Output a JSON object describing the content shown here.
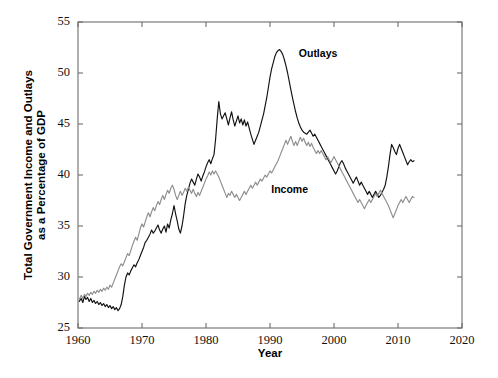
{
  "chart_data": {
    "type": "line",
    "title": "",
    "xlabel": "Year",
    "ylabel": "Total Government Income and Outlays as a Percentage of GDP",
    "ylabel_line1": "Total Government Income and Outlays",
    "ylabel_line2": "as a Percentage of GDP",
    "xlim": [
      1960,
      2020
    ],
    "ylim": [
      25,
      55
    ],
    "xticks": [
      1960,
      1970,
      1980,
      1990,
      2000,
      2010,
      2020
    ],
    "yticks": [
      25,
      30,
      35,
      40,
      45,
      50,
      55
    ],
    "xtick_labels": [
      "1960",
      "1970",
      "1980",
      "1990",
      "2000",
      "2010",
      "2020"
    ],
    "ytick_labels": [
      "25",
      "30",
      "35",
      "40",
      "45",
      "50",
      "55"
    ],
    "grid": false,
    "legend_position": "inline-annotation",
    "colors": {
      "outlays": "#111111",
      "income": "#8e8e8e",
      "axis": "#6d6d6d"
    },
    "annotations": [
      {
        "text": "Outlays",
        "x": 1994.5,
        "y": 51.6
      },
      {
        "text": "Income",
        "x": 1990.2,
        "y": 38.2
      }
    ],
    "series": [
      {
        "name": "Outlays",
        "color": "#111111",
        "x": [
          1960.2,
          1960.5,
          1960.75,
          1961,
          1961.25,
          1961.5,
          1961.75,
          1962,
          1962.25,
          1962.5,
          1962.75,
          1963,
          1963.25,
          1963.5,
          1963.75,
          1964,
          1964.25,
          1964.5,
          1964.75,
          1965,
          1965.25,
          1965.5,
          1965.75,
          1966,
          1966.25,
          1966.5,
          1966.75,
          1967,
          1967.25,
          1967.5,
          1967.75,
          1968,
          1968.25,
          1968.5,
          1968.75,
          1969,
          1969.25,
          1969.5,
          1969.75,
          1970,
          1970.25,
          1970.5,
          1970.75,
          1971,
          1971.25,
          1971.5,
          1971.75,
          1972,
          1972.25,
          1972.5,
          1972.75,
          1973,
          1973.25,
          1973.5,
          1973.75,
          1974,
          1974.25,
          1974.5,
          1974.75,
          1975,
          1975.25,
          1975.5,
          1975.75,
          1976,
          1976.25,
          1976.5,
          1976.75,
          1977,
          1977.25,
          1977.5,
          1977.75,
          1978,
          1978.25,
          1978.5,
          1978.75,
          1979,
          1979.25,
          1979.5,
          1979.75,
          1980,
          1980.25,
          1980.5,
          1980.75,
          1981,
          1981.25,
          1981.5,
          1981.75,
          1982,
          1982.25,
          1982.5,
          1982.75,
          1983,
          1983.25,
          1983.5,
          1983.75,
          1984,
          1984.25,
          1984.5,
          1984.75,
          1985,
          1985.25,
          1985.5,
          1985.75,
          1986,
          1986.25,
          1986.5,
          1986.75,
          1987,
          1987.25,
          1987.5,
          1987.75,
          1988,
          1988.25,
          1988.5,
          1988.75,
          1989,
          1989.25,
          1989.5,
          1989.75,
          1990,
          1990.25,
          1990.5,
          1990.75,
          1991,
          1991.25,
          1991.5,
          1991.75,
          1992,
          1992.25,
          1992.5,
          1992.75,
          1993,
          1993.25,
          1993.5,
          1993.75,
          1994,
          1994.25,
          1994.5,
          1994.75,
          1995,
          1995.25,
          1995.5,
          1995.75,
          1996,
          1996.25,
          1996.5,
          1996.75,
          1997,
          1997.25,
          1997.5,
          1997.75,
          1998,
          1998.25,
          1998.5,
          1998.75,
          1999,
          1999.25,
          1999.5,
          1999.75,
          2000,
          2000.25,
          2000.5,
          2000.75,
          2001,
          2001.25,
          2001.5,
          2001.75,
          2002,
          2002.25,
          2002.5,
          2002.75,
          2003,
          2003.25,
          2003.5,
          2003.75,
          2004,
          2004.25,
          2004.5,
          2004.75,
          2005,
          2005.25,
          2005.5,
          2005.75,
          2006,
          2006.25,
          2006.5,
          2006.75,
          2007,
          2007.25,
          2007.5,
          2007.75,
          2008,
          2008.25,
          2008.5,
          2008.75,
          2009,
          2009.25,
          2009.5,
          2009.75,
          2010,
          2010.25,
          2010.5,
          2010.75,
          2011,
          2011.25,
          2011.5,
          2011.75,
          2012,
          2012.25,
          2012.5
        ],
        "y": [
          27.6,
          27.9,
          27.5,
          28.1,
          27.8,
          28.0,
          27.6,
          27.9,
          27.5,
          27.7,
          27.4,
          27.6,
          27.3,
          27.5,
          27.2,
          27.4,
          27.1,
          27.3,
          27.0,
          27.2,
          26.9,
          27.1,
          26.8,
          27.0,
          26.7,
          26.9,
          27.3,
          28.1,
          29.2,
          30.0,
          30.4,
          30.2,
          30.6,
          30.9,
          31.2,
          31.0,
          31.4,
          31.7,
          32.1,
          32.5,
          32.9,
          33.4,
          33.6,
          33.9,
          34.2,
          34.6,
          34.3,
          34.5,
          34.8,
          35.1,
          34.6,
          34.3,
          34.7,
          35.0,
          34.4,
          35.2,
          34.8,
          35.6,
          36.2,
          37.0,
          36.2,
          35.5,
          34.7,
          34.3,
          35.0,
          36.0,
          37.2,
          38.0,
          38.6,
          39.2,
          39.6,
          39.3,
          39.0,
          39.6,
          40.1,
          39.8,
          39.4,
          39.9,
          40.3,
          40.8,
          41.2,
          41.5,
          41.1,
          41.6,
          42.0,
          43.5,
          45.5,
          47.2,
          46.0,
          45.5,
          45.8,
          46.1,
          45.5,
          44.9,
          45.6,
          46.2,
          45.4,
          44.8,
          45.3,
          45.8,
          45.1,
          45.5,
          44.9,
          45.4,
          44.8,
          45.2,
          44.6,
          44.0,
          43.5,
          43.0,
          43.4,
          43.8,
          44.2,
          44.8,
          45.4,
          46.0,
          46.8,
          47.6,
          48.6,
          49.6,
          50.4,
          51.0,
          51.6,
          52.0,
          52.2,
          52.3,
          52.1,
          51.8,
          51.3,
          50.7,
          50.0,
          49.2,
          48.4,
          47.6,
          46.9,
          46.2,
          45.6,
          45.1,
          44.7,
          44.4,
          44.2,
          44.1,
          44.0,
          44.2,
          44.4,
          44.1,
          43.8,
          44.0,
          43.7,
          43.4,
          43.1,
          42.8,
          42.5,
          42.2,
          41.9,
          41.6,
          41.3,
          41.0,
          40.7,
          40.4,
          40.1,
          40.4,
          40.8,
          41.2,
          41.4,
          41.1,
          40.7,
          40.4,
          40.1,
          39.8,
          39.5,
          39.2,
          39.5,
          39.8,
          39.4,
          39.0,
          39.3,
          39.0,
          38.7,
          38.4,
          38.1,
          38.4,
          38.1,
          37.8,
          38.1,
          38.4,
          38.1,
          37.8,
          38.0,
          38.3,
          38.6,
          39.0,
          39.8,
          40.8,
          42.0,
          43.0,
          42.7,
          42.3,
          42.0,
          42.6,
          43.0,
          42.6,
          42.2,
          41.8,
          41.4,
          41.0,
          41.3,
          41.5,
          41.3,
          41.4
        ]
      },
      {
        "name": "Income",
        "color": "#8e8e8e",
        "x": [
          1960.2,
          1960.5,
          1960.75,
          1961,
          1961.25,
          1961.5,
          1961.75,
          1962,
          1962.25,
          1962.5,
          1962.75,
          1963,
          1963.25,
          1963.5,
          1963.75,
          1964,
          1964.25,
          1964.5,
          1964.75,
          1965,
          1965.25,
          1965.5,
          1965.75,
          1966,
          1966.25,
          1966.5,
          1966.75,
          1967,
          1967.25,
          1967.5,
          1967.75,
          1968,
          1968.25,
          1968.5,
          1968.75,
          1969,
          1969.25,
          1969.5,
          1969.75,
          1970,
          1970.25,
          1970.5,
          1970.75,
          1971,
          1971.25,
          1971.5,
          1971.75,
          1972,
          1972.25,
          1972.5,
          1972.75,
          1973,
          1973.25,
          1973.5,
          1973.75,
          1974,
          1974.25,
          1974.5,
          1974.75,
          1975,
          1975.25,
          1975.5,
          1975.75,
          1976,
          1976.25,
          1976.5,
          1976.75,
          1977,
          1977.25,
          1977.5,
          1977.75,
          1978,
          1978.25,
          1978.5,
          1978.75,
          1979,
          1979.25,
          1979.5,
          1979.75,
          1980,
          1980.25,
          1980.5,
          1980.75,
          1981,
          1981.25,
          1981.5,
          1981.75,
          1982,
          1982.25,
          1982.5,
          1982.75,
          1983,
          1983.25,
          1983.5,
          1983.75,
          1984,
          1984.25,
          1984.5,
          1984.75,
          1985,
          1985.25,
          1985.5,
          1985.75,
          1986,
          1986.25,
          1986.5,
          1986.75,
          1987,
          1987.25,
          1987.5,
          1987.75,
          1988,
          1988.25,
          1988.5,
          1988.75,
          1989,
          1989.25,
          1989.5,
          1989.75,
          1990,
          1990.25,
          1990.5,
          1990.75,
          1991,
          1991.25,
          1991.5,
          1991.75,
          1992,
          1992.25,
          1992.5,
          1992.75,
          1993,
          1993.25,
          1993.5,
          1993.75,
          1994,
          1994.25,
          1994.5,
          1994.75,
          1995,
          1995.25,
          1995.5,
          1995.75,
          1996,
          1996.25,
          1996.5,
          1996.75,
          1997,
          1997.25,
          1997.5,
          1997.75,
          1998,
          1998.25,
          1998.5,
          1998.75,
          1999,
          1999.25,
          1999.5,
          1999.75,
          2000,
          2000.25,
          2000.5,
          2000.75,
          2001,
          2001.25,
          2001.5,
          2001.75,
          2002,
          2002.25,
          2002.5,
          2002.75,
          2003,
          2003.25,
          2003.5,
          2003.75,
          2004,
          2004.25,
          2004.5,
          2004.75,
          2005,
          2005.25,
          2005.5,
          2005.75,
          2006,
          2006.25,
          2006.5,
          2006.75,
          2007,
          2007.25,
          2007.5,
          2007.75,
          2008,
          2008.25,
          2008.5,
          2008.75,
          2009,
          2009.25,
          2009.5,
          2009.75,
          2010,
          2010.25,
          2010.5,
          2010.75,
          2011,
          2011.25,
          2011.5,
          2011.75,
          2012,
          2012.25,
          2012.5
        ],
        "y": [
          27.8,
          28.2,
          27.9,
          28.3,
          28.1,
          28.4,
          28.2,
          28.5,
          28.3,
          28.6,
          28.4,
          28.7,
          28.5,
          28.8,
          28.6,
          28.9,
          28.7,
          29.0,
          28.8,
          29.2,
          29.0,
          29.4,
          29.8,
          30.2,
          30.6,
          31.0,
          31.3,
          31.1,
          31.5,
          31.9,
          32.3,
          32.1,
          32.6,
          33.1,
          33.5,
          33.9,
          33.6,
          34.2,
          34.8,
          35.2,
          34.9,
          35.4,
          35.9,
          36.3,
          35.9,
          36.4,
          36.8,
          36.5,
          37.0,
          37.4,
          37.1,
          37.6,
          38.0,
          37.6,
          38.1,
          38.5,
          38.2,
          38.7,
          39.0,
          38.6,
          38.0,
          37.6,
          38.0,
          38.4,
          38.0,
          38.3,
          38.7,
          38.4,
          38.8,
          38.5,
          38.2,
          38.6,
          38.2,
          37.9,
          38.3,
          38.0,
          38.4,
          38.8,
          39.2,
          39.6,
          39.9,
          40.3,
          40.0,
          40.4,
          40.1,
          40.4,
          40.1,
          39.8,
          39.4,
          39.0,
          38.6,
          38.2,
          37.8,
          38.2,
          38.0,
          38.4,
          38.1,
          37.8,
          38.1,
          37.8,
          37.5,
          37.8,
          38.1,
          38.4,
          38.1,
          38.4,
          38.7,
          39.0,
          38.7,
          39.0,
          39.3,
          39.0,
          39.3,
          39.6,
          39.4,
          39.7,
          40.0,
          39.8,
          40.1,
          40.4,
          40.2,
          40.5,
          40.8,
          41.1,
          41.4,
          41.8,
          42.2,
          42.6,
          43.0,
          43.4,
          43.0,
          43.4,
          43.8,
          43.3,
          42.9,
          43.3,
          42.9,
          43.3,
          43.7,
          43.3,
          43.6,
          43.2,
          42.9,
          43.2,
          42.8,
          43.1,
          42.7,
          42.4,
          42.1,
          42.4,
          42.1,
          42.4,
          42.1,
          41.8,
          41.5,
          41.8,
          41.5,
          41.2,
          41.5,
          41.8,
          41.5,
          41.2,
          40.9,
          40.6,
          40.3,
          40.0,
          39.7,
          39.4,
          39.1,
          38.8,
          38.5,
          38.2,
          37.9,
          37.6,
          37.3,
          37.6,
          37.3,
          37.0,
          36.7,
          37.0,
          37.3,
          37.6,
          37.3,
          37.6,
          37.9,
          38.2,
          37.9,
          38.2,
          38.5,
          38.2,
          37.9,
          37.6,
          37.3,
          37.0,
          36.6,
          36.2,
          35.8,
          36.2,
          36.6,
          37.0,
          37.3,
          37.6,
          37.3,
          37.6,
          37.9,
          37.6,
          37.3,
          37.6,
          37.9,
          37.8
        ]
      }
    ]
  }
}
